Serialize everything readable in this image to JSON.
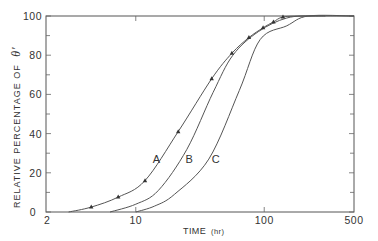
{
  "chart_data": {
    "type": "line",
    "title": "",
    "xlabel": "TIME (hr)",
    "xlabel_main": "TIME",
    "xlabel_unit": "(hr)",
    "ylabel": "RELATIVE PERCENTAGE OF θ′",
    "ylabel_main": "RELATIVE PERCENTAGE OF",
    "ylabel_symbol": "θ′",
    "xscale": "log",
    "xlim": [
      2,
      500
    ],
    "ylim": [
      0,
      100
    ],
    "x_ticks": [
      {
        "value": 2,
        "label": "2"
      },
      {
        "value": 10,
        "label": "10"
      },
      {
        "value": 100,
        "label": "100"
      },
      {
        "value": 500,
        "label": "500"
      }
    ],
    "y_ticks": [
      {
        "value": 0,
        "label": "0"
      },
      {
        "value": 20,
        "label": "20"
      },
      {
        "value": 40,
        "label": "40"
      },
      {
        "value": 60,
        "label": "60"
      },
      {
        "value": 80,
        "label": "80"
      },
      {
        "value": 100,
        "label": "100"
      }
    ],
    "y_minor_ticks": [
      10,
      30,
      50,
      70,
      90
    ],
    "grid": false,
    "legend": "none (curves labeled inline A, B, C)",
    "series": [
      {
        "name": "A",
        "label_pos": {
          "x": 14.5,
          "y": 27
        },
        "x": [
          3.0,
          4.5,
          7.3,
          11.8,
          21.4,
          39,
          56,
          76,
          98,
          118,
          140,
          200,
          300
        ],
        "y": [
          0,
          2.5,
          7.6,
          16,
          41,
          68,
          81,
          89,
          94,
          97,
          99.5,
          100,
          100
        ],
        "markers": {
          "x": [
            4.5,
            7.3,
            11.8,
            21.4,
            39,
            56,
            76,
            98,
            118,
            140
          ],
          "y": [
            2.5,
            7.6,
            16,
            41,
            68,
            81,
            89,
            94,
            97,
            99.5
          ],
          "shape": "triangle"
        }
      },
      {
        "name": "B",
        "label_pos": {
          "x": 26,
          "y": 27
        },
        "x": [
          6.3,
          10,
          15,
          25,
          40,
          57,
          90,
          150,
          250,
          500
        ],
        "y": [
          0,
          4,
          11,
          32,
          61,
          80,
          92,
          99,
          100,
          100
        ]
      },
      {
        "name": "C",
        "label_pos": {
          "x": 42,
          "y": 27
        },
        "x": [
          10,
          14,
          20,
          37,
          64,
          93,
          150,
          220,
          500
        ],
        "y": [
          0,
          3,
          9,
          27,
          62,
          88,
          95,
          100,
          100
        ]
      }
    ]
  },
  "layout": {
    "plot_left": 46,
    "plot_right": 354,
    "plot_top": 16,
    "plot_bottom": 212,
    "line_color": "#555555",
    "text_color": "#333333"
  }
}
